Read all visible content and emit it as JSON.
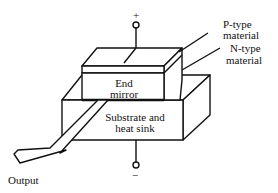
{
  "diagram": {
    "labels": {
      "plus": "+",
      "minus": "−",
      "p_type_line1": "P-type",
      "p_type_line2": "material",
      "n_type_line1": "N-type",
      "n_type_line2": "material",
      "end_mirror_line1": "End",
      "end_mirror_line2": "mirror",
      "substrate_line1": "Substrate and",
      "substrate_line2": "heat sink",
      "output": "Output"
    },
    "colors": {
      "stroke": "#111111",
      "fill": "#ffffff"
    }
  }
}
